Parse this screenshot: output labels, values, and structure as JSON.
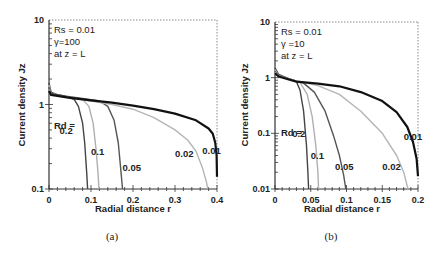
{
  "chart_data": [
    {
      "id": "a",
      "type": "line",
      "caption": "(a)",
      "xlabel": "Radial distance r",
      "ylabel": "Current density Jz",
      "yscale": "log",
      "xlim": [
        0,
        0.4
      ],
      "ylim": [
        0.1,
        10
      ],
      "x_ticks": [
        "0",
        "0.1",
        "0.2",
        "0.3",
        "0.4"
      ],
      "y_ticks": [
        "0.1",
        "1",
        "10"
      ],
      "annotations": [
        "Rs = 0.01",
        "γ=100",
        "at z = L"
      ],
      "legend_title": "Rd =",
      "grid": false,
      "series": [
        {
          "name": "0.2",
          "color": "#444444",
          "width": 1.4,
          "points": [
            [
              0,
              1.8
            ],
            [
              0.005,
              1.4
            ],
            [
              0.02,
              1.3
            ],
            [
              0.04,
              1.25
            ],
            [
              0.06,
              1.15
            ],
            [
              0.07,
              0.95
            ],
            [
              0.08,
              0.6
            ],
            [
              0.085,
              0.35
            ],
            [
              0.09,
              0.15
            ],
            [
              0.092,
              0.1
            ]
          ]
        },
        {
          "name": "0.1",
          "color": "#b0b0b0",
          "width": 1.4,
          "points": [
            [
              0,
              1.7
            ],
            [
              0.005,
              1.35
            ],
            [
              0.03,
              1.28
            ],
            [
              0.06,
              1.2
            ],
            [
              0.08,
              1.15
            ],
            [
              0.095,
              0.95
            ],
            [
              0.105,
              0.6
            ],
            [
              0.112,
              0.3
            ],
            [
              0.117,
              0.15
            ],
            [
              0.119,
              0.1
            ]
          ]
        },
        {
          "name": "0.05",
          "color": "#555555",
          "width": 1.4,
          "points": [
            [
              0,
              1.6
            ],
            [
              0.005,
              1.35
            ],
            [
              0.04,
              1.25
            ],
            [
              0.08,
              1.18
            ],
            [
              0.12,
              1.1
            ],
            [
              0.14,
              0.95
            ],
            [
              0.155,
              0.65
            ],
            [
              0.165,
              0.35
            ],
            [
              0.172,
              0.15
            ],
            [
              0.175,
              0.1
            ]
          ]
        },
        {
          "name": "0.02",
          "color": "#b5b5b5",
          "width": 1.4,
          "points": [
            [
              0,
              1.5
            ],
            [
              0.005,
              1.3
            ],
            [
              0.05,
              1.2
            ],
            [
              0.1,
              1.1
            ],
            [
              0.15,
              1.0
            ],
            [
              0.2,
              0.88
            ],
            [
              0.25,
              0.7
            ],
            [
              0.3,
              0.5
            ],
            [
              0.33,
              0.38
            ],
            [
              0.35,
              0.28
            ],
            [
              0.365,
              0.18
            ],
            [
              0.375,
              0.12
            ],
            [
              0.378,
              0.1
            ]
          ]
        },
        {
          "name": "0.01",
          "color": "#111111",
          "width": 2.2,
          "points": [
            [
              0,
              1.45
            ],
            [
              0.005,
              1.3
            ],
            [
              0.05,
              1.2
            ],
            [
              0.1,
              1.12
            ],
            [
              0.15,
              1.05
            ],
            [
              0.2,
              0.97
            ],
            [
              0.25,
              0.88
            ],
            [
              0.3,
              0.78
            ],
            [
              0.35,
              0.65
            ],
            [
              0.38,
              0.52
            ],
            [
              0.39,
              0.45
            ],
            [
              0.396,
              0.35
            ],
            [
              0.399,
              0.25
            ],
            [
              0.4,
              0.14
            ]
          ]
        }
      ],
      "curve_labels": [
        {
          "text": "0.2",
          "x": 0.025,
          "y": 0.45
        },
        {
          "text": "0.1",
          "x": 0.1,
          "y": 0.25
        },
        {
          "text": "0.05",
          "x": 0.175,
          "y": 0.165
        },
        {
          "text": "0.02",
          "x": 0.3,
          "y": 0.24
        },
        {
          "text": "0.01",
          "x": 0.365,
          "y": 0.26
        }
      ]
    },
    {
      "id": "b",
      "type": "line",
      "caption": "(b)",
      "xlabel": "Radial distance r",
      "ylabel": "Current density Jz",
      "yscale": "log",
      "xlim": [
        0,
        0.2
      ],
      "ylim": [
        0.01,
        10
      ],
      "x_ticks": [
        "0",
        "0.05",
        "0.1",
        "0.15",
        "0.2"
      ],
      "y_ticks": [
        "0.01",
        "0.1",
        "1",
        "10"
      ],
      "annotations": [
        "Rs = 0.01",
        "γ =10",
        "at z = L"
      ],
      "legend_title": "Rd =",
      "grid": false,
      "series": [
        {
          "name": "0.2",
          "color": "#444444",
          "width": 1.4,
          "points": [
            [
              0,
              1.5
            ],
            [
              0.005,
              1.15
            ],
            [
              0.02,
              0.95
            ],
            [
              0.03,
              0.85
            ],
            [
              0.035,
              0.6
            ],
            [
              0.04,
              0.25
            ],
            [
              0.044,
              0.06
            ],
            [
              0.046,
              0.02
            ],
            [
              0.047,
              0.01
            ]
          ]
        },
        {
          "name": "0.1",
          "color": "#b0b0b0",
          "width": 1.4,
          "points": [
            [
              0,
              1.4
            ],
            [
              0.005,
              1.1
            ],
            [
              0.02,
              0.95
            ],
            [
              0.035,
              0.82
            ],
            [
              0.045,
              0.5
            ],
            [
              0.052,
              0.2
            ],
            [
              0.057,
              0.06
            ],
            [
              0.06,
              0.02
            ],
            [
              0.061,
              0.01
            ]
          ]
        },
        {
          "name": "0.05",
          "color": "#555555",
          "width": 1.4,
          "points": [
            [
              0,
              1.3
            ],
            [
              0.005,
              1.1
            ],
            [
              0.02,
              0.95
            ],
            [
              0.04,
              0.8
            ],
            [
              0.055,
              0.55
            ],
            [
              0.07,
              0.25
            ],
            [
              0.082,
              0.09
            ],
            [
              0.09,
              0.04
            ],
            [
              0.096,
              0.018
            ],
            [
              0.099,
              0.01
            ]
          ]
        },
        {
          "name": "0.02",
          "color": "#b5b5b5",
          "width": 1.4,
          "points": [
            [
              0,
              1.25
            ],
            [
              0.005,
              1.08
            ],
            [
              0.03,
              0.88
            ],
            [
              0.06,
              0.72
            ],
            [
              0.09,
              0.5
            ],
            [
              0.12,
              0.25
            ],
            [
              0.15,
              0.1
            ],
            [
              0.17,
              0.04
            ],
            [
              0.18,
              0.02
            ],
            [
              0.186,
              0.01
            ]
          ]
        },
        {
          "name": "0.01",
          "color": "#111111",
          "width": 2.2,
          "points": [
            [
              0,
              1.2
            ],
            [
              0.005,
              1.05
            ],
            [
              0.03,
              0.85
            ],
            [
              0.06,
              0.78
            ],
            [
              0.09,
              0.7
            ],
            [
              0.12,
              0.55
            ],
            [
              0.15,
              0.38
            ],
            [
              0.17,
              0.24
            ],
            [
              0.185,
              0.13
            ],
            [
              0.193,
              0.07
            ],
            [
              0.198,
              0.035
            ],
            [
              0.2,
              0.017
            ]
          ]
        }
      ],
      "curve_labels": [
        {
          "text": "0.2",
          "x": 0.024,
          "y": 0.085
        },
        {
          "text": "0.1",
          "x": 0.05,
          "y": 0.035
        },
        {
          "text": "0.05",
          "x": 0.084,
          "y": 0.022
        },
        {
          "text": "0.02",
          "x": 0.15,
          "y": 0.022
        },
        {
          "text": "0.01",
          "x": 0.18,
          "y": 0.075
        }
      ]
    }
  ]
}
